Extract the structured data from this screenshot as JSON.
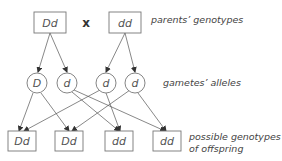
{
  "diagram": {
    "cross_symbol": "x",
    "labels": {
      "parents": "parents’ genotypes",
      "gametes": "gametes’ alleles",
      "offspring_line1": "possible genotypes",
      "offspring_line2": "of offspring"
    },
    "parents": [
      {
        "id": "p1",
        "genotype": "Dd"
      },
      {
        "id": "p2",
        "genotype": "dd"
      }
    ],
    "gametes": [
      {
        "id": "g1",
        "allele": "D",
        "from": "p1"
      },
      {
        "id": "g2",
        "allele": "d",
        "from": "p1"
      },
      {
        "id": "g3",
        "allele": "d",
        "from": "p2"
      },
      {
        "id": "g4",
        "allele": "d",
        "from": "p2"
      }
    ],
    "offspring": [
      {
        "id": "o1",
        "genotype": "Dd"
      },
      {
        "id": "o2",
        "genotype": "Dd"
      },
      {
        "id": "o3",
        "genotype": "dd"
      },
      {
        "id": "o4",
        "genotype": "dd"
      }
    ],
    "edges": [
      [
        "p1",
        "g1"
      ],
      [
        "p1",
        "g2"
      ],
      [
        "p2",
        "g3"
      ],
      [
        "p2",
        "g4"
      ],
      [
        "g1",
        "o1"
      ],
      [
        "g1",
        "o2"
      ],
      [
        "g2",
        "o3"
      ],
      [
        "g2",
        "o4"
      ],
      [
        "g3",
        "o1"
      ],
      [
        "g3",
        "o3"
      ],
      [
        "g4",
        "o2"
      ],
      [
        "g4",
        "o4"
      ]
    ]
  }
}
